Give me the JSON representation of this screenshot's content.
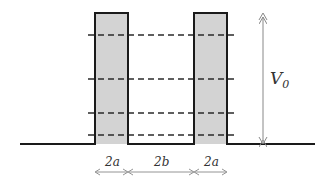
{
  "diagram": {
    "type": "double-barrier potential",
    "colors": {
      "line": "#1a1a1a",
      "barrier_fill": "#d3d3d3",
      "dashed": "#2a2a2a",
      "arrow": "#888888",
      "text": "#333333"
    },
    "barriers": [
      {
        "name": "left-barrier",
        "x1": 95,
        "x2": 128
      },
      {
        "name": "right-barrier",
        "x1": 194,
        "x2": 227
      }
    ],
    "baseline_y": 144,
    "top_y": 13,
    "energy_levels_y": [
      35,
      79,
      113,
      135
    ],
    "labels": {
      "height": "V",
      "height_sub": "0",
      "width_left": "2a",
      "gap": "2b",
      "width_right": "2a"
    }
  }
}
